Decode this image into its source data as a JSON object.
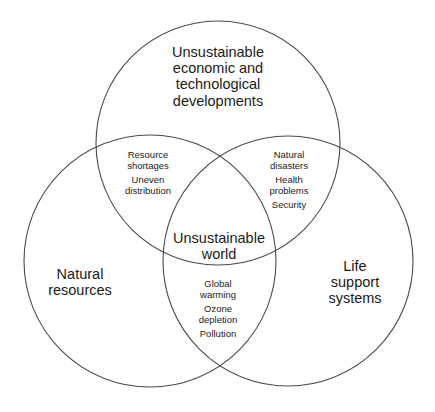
{
  "diagram": {
    "type": "venn",
    "circles": [
      {
        "id": "top",
        "label_lines": [
          "Unsustainable",
          "economic and",
          "technological",
          "developments"
        ],
        "cx": 218,
        "cy": 143,
        "r": 122
      },
      {
        "id": "left",
        "label_lines": [
          "Natural",
          "resources"
        ],
        "cx": 150,
        "cy": 261,
        "r": 126
      },
      {
        "id": "right",
        "label_lines": [
          "Life",
          "support",
          "systems"
        ],
        "cx": 288,
        "cy": 261,
        "r": 125
      }
    ],
    "intersections": {
      "top_left": {
        "items": [
          {
            "lines": [
              "Resource",
              "shortages"
            ]
          },
          {
            "lines": [
              "Uneven",
              "distribution"
            ]
          }
        ]
      },
      "top_right": {
        "items": [
          {
            "lines": [
              "Natural",
              "disasters"
            ]
          },
          {
            "lines": [
              "Health",
              "problems"
            ]
          },
          {
            "lines": [
              "Security"
            ]
          }
        ]
      },
      "left_right": {
        "items": [
          {
            "lines": [
              "Global",
              "warming"
            ]
          },
          {
            "lines": [
              "Ozone",
              "depletion"
            ]
          },
          {
            "lines": [
              "Pollution"
            ]
          }
        ]
      },
      "center": {
        "lines": [
          "Unsustainable",
          "world"
        ]
      }
    },
    "stroke_color": "#4a4a4a",
    "text_color": "#1a1a1a",
    "background": "#ffffff"
  }
}
